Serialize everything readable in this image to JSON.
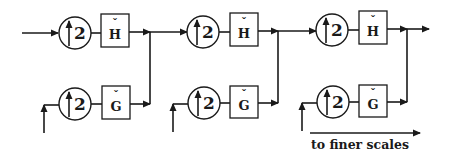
{
  "diagram": {
    "type": "filter-bank-reconstruction",
    "stages": [
      {
        "upper": {
          "upsampler": "2",
          "filter": "H",
          "filter_accent": "ˇ"
        },
        "lower": {
          "upsampler": "2",
          "filter": "G",
          "filter_accent": "ˇ"
        }
      },
      {
        "upper": {
          "upsampler": "2",
          "filter": "H",
          "filter_accent": "ˇ"
        },
        "lower": {
          "upsampler": "2",
          "filter": "G",
          "filter_accent": "ˇ"
        }
      },
      {
        "upper": {
          "upsampler": "2",
          "filter": "H",
          "filter_accent": "ˇ"
        },
        "lower": {
          "upsampler": "2",
          "filter": "G",
          "filter_accent": "ˇ"
        }
      }
    ],
    "caption": "to finer scales",
    "colors": {
      "ink": "#1a1a1a",
      "background": "#ffffff"
    }
  }
}
